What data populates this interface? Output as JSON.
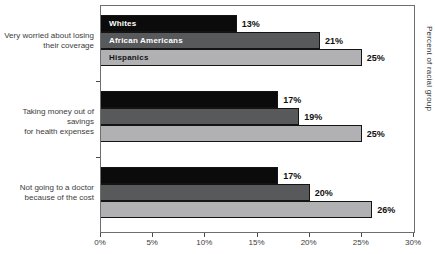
{
  "chart_data": {
    "type": "bar",
    "orientation": "horizontal",
    "title": "",
    "categories": [
      "Very worried about losing their coverage",
      "Taking money out of savings for health expenses",
      "Not going to a doctor because of the cost"
    ],
    "category_label_lines": [
      [
        "Very worried about losing",
        "their coverage"
      ],
      [
        "Taking money out of savings",
        "for health expenses"
      ],
      [
        "Not going to a doctor",
        "because of the cost"
      ]
    ],
    "series": [
      {
        "key": "whites",
        "name": "Whites",
        "values": [
          13,
          17,
          17
        ],
        "color": "#0b0b0b",
        "label_color": "#ffffff"
      },
      {
        "key": "african-americans",
        "name": "African Americans",
        "values": [
          21,
          19,
          20
        ],
        "color": "#58595b",
        "label_color": "#ffffff"
      },
      {
        "key": "hispanics",
        "name": "Hispanics",
        "values": [
          25,
          25,
          26
        ],
        "color": "#b1b1b3",
        "label_color": "#141414"
      }
    ],
    "value_suffix": "%",
    "xlim": [
      0,
      30
    ],
    "x_tick_labels": [
      "0%",
      "5%",
      "10%",
      "15%",
      "20%",
      "25%",
      "30%"
    ],
    "right_axis_label": "Percent of racial group",
    "bar_border_color": "#141414",
    "grid": false,
    "legend_position": "labels-inside-first-group-bars"
  }
}
